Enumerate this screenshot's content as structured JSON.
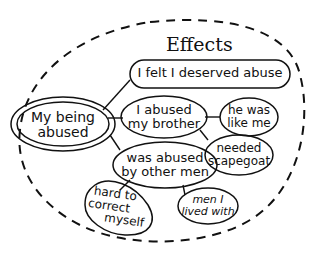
{
  "diagram": {
    "title": "Effects",
    "root": {
      "line1": "My being",
      "line2": "abused"
    },
    "nodes": [
      {
        "id": "deserved",
        "line1": "I felt I deserved abuse",
        "line2": ""
      },
      {
        "id": "abused-brother",
        "line1": "I abused",
        "line2": "my brother"
      },
      {
        "id": "like-me",
        "line1": "he was",
        "line2": "like me"
      },
      {
        "id": "scapegoat",
        "line1": "needed",
        "line2": "scapegoat"
      },
      {
        "id": "other-men",
        "line1": "was abused",
        "line2": "by other men"
      },
      {
        "id": "lived-with",
        "line1": "men I",
        "line2": "lived with"
      },
      {
        "id": "correct",
        "line1": "hard to",
        "line2": "correct",
        "line3": "myself"
      }
    ],
    "edges": [
      [
        "root",
        "deserved"
      ],
      [
        "root",
        "abused-brother"
      ],
      [
        "root",
        "other-men"
      ],
      [
        "abused-brother",
        "like-me"
      ],
      [
        "abused-brother",
        "scapegoat"
      ],
      [
        "other-men",
        "lived-with"
      ],
      [
        "other-men",
        "correct"
      ]
    ],
    "colors": {
      "ink": "#111111",
      "background": "#ffffff"
    }
  }
}
